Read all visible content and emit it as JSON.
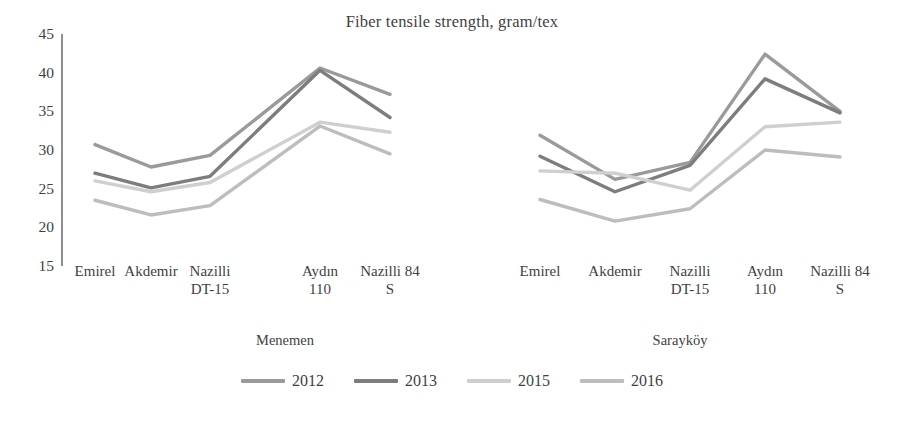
{
  "chart_data": {
    "type": "line",
    "title": "Fiber tensile strength, gram/tex",
    "xlabel": "",
    "ylabel": "",
    "ylim": [
      15,
      45
    ],
    "yticks": [
      45,
      40,
      35,
      30,
      25,
      20,
      15
    ],
    "grid": false,
    "legend_position": "bottom",
    "groups": [
      {
        "name": "Menemen",
        "categories": [
          "Emirel",
          "Akdemir",
          "Nazilli\nDT-15",
          "Aydın\n110",
          "Nazilli 84\nS"
        ]
      },
      {
        "name": "Sarayköy",
        "categories": [
          "Emirel",
          "Akdemir",
          "Nazilli\nDT-15",
          "Aydın\n110",
          "Nazilli 84\nS"
        ]
      }
    ],
    "categories": [
      "Menemen / Emirel",
      "Menemen / Akdemir",
      "Menemen / Nazilli DT-15",
      "Menemen / Aydın 110",
      "Menemen / Nazilli 84 S",
      "Sarayköy / Emirel",
      "Sarayköy / Akdemir",
      "Sarayköy / Nazilli DT-15",
      "Sarayköy / Aydın 110",
      "Sarayköy / Nazilli 84 S"
    ],
    "series": [
      {
        "name": "2012",
        "color": "#9a9a9a",
        "values_menemen": [
          30.7,
          27.8,
          29.3,
          40.6,
          37.2
        ],
        "values_saraykoy": [
          31.9,
          26.2,
          28.4,
          42.4,
          35.0
        ]
      },
      {
        "name": "2013",
        "color": "#7d7d7d",
        "values_menemen": [
          27.0,
          25.1,
          26.6,
          40.3,
          34.2
        ],
        "values_saraykoy": [
          29.2,
          24.6,
          28.0,
          39.2,
          34.8
        ]
      },
      {
        "name": "2015",
        "color": "#cfcfcf",
        "values_menemen": [
          26.0,
          24.6,
          25.8,
          33.6,
          32.3
        ],
        "values_saraykoy": [
          27.3,
          27.0,
          24.8,
          33.0,
          33.6
        ]
      },
      {
        "name": "2016",
        "color": "#bdbdbd",
        "values_menemen": [
          23.5,
          21.6,
          22.8,
          33.1,
          29.5
        ],
        "values_saraykoy": [
          23.6,
          20.8,
          22.4,
          30.0,
          29.1
        ]
      }
    ]
  },
  "legend": {
    "items": [
      {
        "label": "2012"
      },
      {
        "label": "2013"
      },
      {
        "label": "2015"
      },
      {
        "label": "2016"
      }
    ]
  }
}
